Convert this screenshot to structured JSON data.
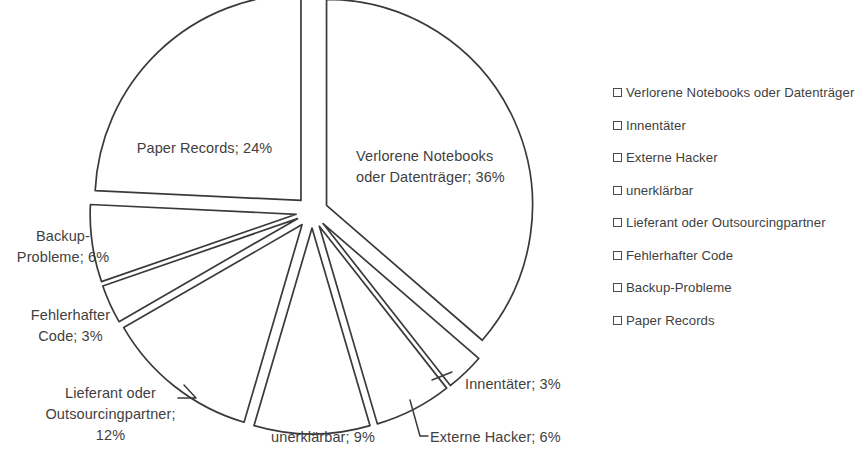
{
  "chart_data": {
    "type": "pie",
    "title": "",
    "exploded": true,
    "labels": [
      "Verlorene Notebooks oder Datenträger",
      "Innentäter",
      "Externe Hacker",
      "unerklärbar",
      "Lieferant oder Outsourcingpartner",
      "Fehlerhafter Code",
      "Backup-Probleme",
      "Paper Records"
    ],
    "values": [
      36,
      3,
      6,
      9,
      12,
      3,
      6,
      24
    ],
    "unit": "%",
    "data_labels": [
      "Verlorene Notebooks\noder Datenträger; 36%",
      "Innentäter; 3%",
      "Externe Hacker; 6%",
      "unerklärbar; 9%",
      "Lieferant oder\nOutsourcingpartner;\n12%",
      "Fehlerhafter\nCode; 3%",
      "Backup-\nProbleme; 6%",
      "Paper Records; 24%"
    ],
    "legend_position": "right",
    "slice_fill": "#ffffff",
    "slice_stroke": "#3a3a3a",
    "text_color": "#3f3f3f"
  },
  "legend": {
    "items": [
      {
        "label": "Verlorene Notebooks oder Datenträger"
      },
      {
        "label": "Innentäter"
      },
      {
        "label": "Externe Hacker"
      },
      {
        "label": "unerklärbar"
      },
      {
        "label": "Lieferant oder Outsourcingpartner"
      },
      {
        "label": "Fehlerhafter Code"
      },
      {
        "label": "Backup-Probleme"
      },
      {
        "label": "Paper Records"
      }
    ]
  },
  "labels": {
    "verlorene": "Verlorene Notebooks\noder Datenträger; 36%",
    "innentaeter": "Innentäter; 3%",
    "externe_hacker": "Externe Hacker; 6%",
    "unerklaerbar": "unerklärbar; 9%",
    "lieferant": "Lieferant oder\nOutsourcingpartner;\n12%",
    "fehlerhafter_code": "Fehlerhafter\nCode; 3%",
    "backup_probleme": "Backup-\nProbleme; 6%",
    "paper_records": "Paper Records; 24%"
  }
}
